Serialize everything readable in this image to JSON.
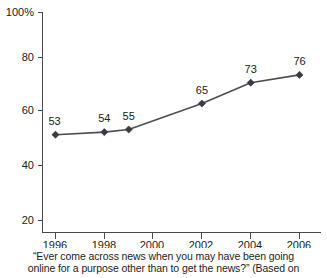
{
  "chart_data": {
    "type": "line",
    "title": "",
    "xlabel": "",
    "ylabel": "",
    "x": [
      1996,
      1998,
      1999,
      2002,
      2004,
      2006
    ],
    "values": [
      53,
      54,
      55,
      65,
      73,
      76
    ],
    "point_labels": [
      "53",
      "54",
      "55",
      "65",
      "73",
      "76"
    ],
    "xlim": [
      1995,
      2007
    ],
    "ylim": [
      15,
      102
    ],
    "x_ticks": [
      "1996",
      "1998",
      "2000",
      "2002",
      "2004",
      "2006"
    ],
    "x_tick_values": [
      1996,
      1998,
      2000,
      2002,
      2004,
      2006
    ],
    "y_ticks": [
      "100%",
      "80",
      "60",
      "40",
      "20"
    ],
    "y_tick_values": [
      100,
      80,
      60,
      40,
      20
    ],
    "grid": false,
    "legend": "none",
    "series": [
      {
        "name": "Ever come across news online incidentally",
        "values": [
          53,
          54,
          55,
          65,
          73,
          76
        ]
      }
    ],
    "marker": "diamond",
    "line_color": "#4d4d55",
    "marker_color": "#3a3a44",
    "axis_color": "#4a4a4a"
  },
  "caption": {
    "line1": "“Ever come across news when you may have been going",
    "line2": "online for a purpose other than to get the news?” (Based on"
  }
}
